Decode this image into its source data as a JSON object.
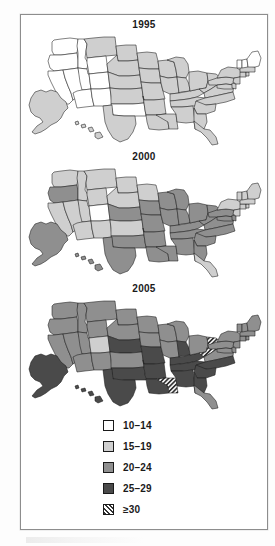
{
  "figure": {
    "type": "choropleth-map-series",
    "panels": [
      {
        "year": "1995",
        "name": "map-1995"
      },
      {
        "year": "2000",
        "name": "map-2000"
      },
      {
        "year": "2005",
        "name": "map-2005"
      }
    ]
  },
  "legend": {
    "title": "",
    "items": [
      {
        "label": "10–14",
        "color": "#ffffff",
        "pattern": "solid",
        "class_index": 0
      },
      {
        "label": "15–19",
        "color": "#cfcfcf",
        "pattern": "solid",
        "class_index": 1
      },
      {
        "label": "20–24",
        "color": "#8f8f8f",
        "pattern": "solid",
        "class_index": 2
      },
      {
        "label": "25–29",
        "color": "#4a4a4a",
        "pattern": "solid",
        "class_index": 3
      },
      {
        "label": "≥30",
        "color": "#3a3a3a",
        "pattern": "hatch",
        "class_index": 4
      }
    ]
  },
  "chart_data": {
    "type": "heatmap",
    "title": "",
    "subtitle": "",
    "xlabel": "",
    "ylabel": "",
    "legend_position": "bottom",
    "grid": false,
    "classes": [
      "10–14",
      "15–19",
      "20–24",
      "25–29",
      "≥30"
    ],
    "class_colors": [
      "#ffffff",
      "#cfcfcf",
      "#8f8f8f",
      "#4a4a4a",
      "#3a3a3a"
    ],
    "categories": [
      "1995",
      "2000",
      "2005"
    ],
    "series": [
      {
        "name": "1995",
        "values": {
          "WA": 0,
          "OR": 0,
          "CA": 0,
          "NV": 0,
          "ID": 0,
          "MT": 1,
          "WY": 0,
          "UT": 0,
          "AZ": 0,
          "CO": 0,
          "NM": 0,
          "ND": 1,
          "SD": 1,
          "NE": 1,
          "KS": 1,
          "OK": 0,
          "TX": 1,
          "MN": 1,
          "IA": 1,
          "MO": 1,
          "AR": 1,
          "LA": 1,
          "WI": 1,
          "IL": 1,
          "MS": 1,
          "MI": 1,
          "IN": 1,
          "KY": 1,
          "TN": 1,
          "AL": 1,
          "OH": 1,
          "WV": 1,
          "GA": 1,
          "FL": 1,
          "SC": 1,
          "NC": 1,
          "VA": 1,
          "PA": 1,
          "NY": 1,
          "MD": 1,
          "DE": 1,
          "NJ": 1,
          "CT": 1,
          "RI": 1,
          "MA": 1,
          "VT": 0,
          "NH": 0,
          "ME": 0,
          "AK": 1,
          "HI": 1
        }
      },
      {
        "name": "2000",
        "values": {
          "WA": 1,
          "OR": 2,
          "CA": 1,
          "NV": 1,
          "ID": 1,
          "MT": 1,
          "WY": 1,
          "UT": 1,
          "AZ": 1,
          "CO": 0,
          "NM": 1,
          "ND": 1,
          "SD": 1,
          "NE": 2,
          "KS": 1,
          "OK": 2,
          "TX": 2,
          "MN": 1,
          "IA": 2,
          "MO": 2,
          "AR": 2,
          "LA": 2,
          "WI": 2,
          "IL": 2,
          "MS": 2,
          "MI": 2,
          "IN": 2,
          "KY": 2,
          "TN": 2,
          "AL": 2,
          "OH": 2,
          "WV": 2,
          "GA": 2,
          "FL": 1,
          "SC": 2,
          "NC": 2,
          "VA": 2,
          "PA": 2,
          "NY": 1,
          "MD": 2,
          "DE": 2,
          "NJ": 1,
          "CT": 1,
          "RI": 1,
          "MA": 1,
          "VT": 1,
          "NH": 1,
          "ME": 1,
          "AK": 2,
          "HI": 2
        }
      },
      {
        "name": "2005",
        "values": {
          "WA": 2,
          "OR": 2,
          "CA": 2,
          "NV": 2,
          "ID": 2,
          "MT": 2,
          "WY": 2,
          "UT": 2,
          "AZ": 2,
          "CO": 1,
          "NM": 2,
          "ND": 2,
          "SD": 2,
          "NE": 3,
          "KS": 2,
          "OK": 3,
          "TX": 3,
          "MN": 2,
          "IA": 2,
          "MO": 3,
          "AR": 3,
          "LA": 3,
          "WI": 2,
          "IL": 2,
          "MS": 4,
          "MI": 2,
          "IN": 3,
          "KY": 3,
          "TN": 3,
          "AL": 3,
          "OH": 2,
          "WV": 4,
          "GA": 3,
          "FL": 2,
          "SC": 3,
          "NC": 3,
          "VA": 2,
          "PA": 2,
          "NY": 2,
          "MD": 2,
          "DE": 2,
          "NJ": 2,
          "CT": 2,
          "RI": 2,
          "MA": 2,
          "VT": 2,
          "NH": 2,
          "ME": 2,
          "AK": 3,
          "HI": 3
        }
      }
    ]
  }
}
